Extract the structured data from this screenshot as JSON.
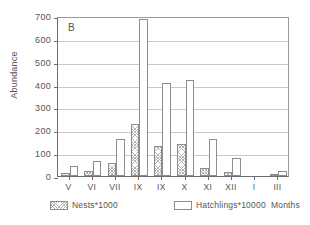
{
  "panel": {
    "letter": "B"
  },
  "axis": {
    "ylabel": "Abundance",
    "xlabel": "Months"
  },
  "legend": {
    "nests_label": "Nests*1000",
    "hatchlings_label": "Hatchlings*10000"
  },
  "chart_data": {
    "type": "bar",
    "title": "B",
    "xlabel": "Months",
    "ylabel": "Abundance",
    "ylim": [
      0,
      700
    ],
    "yticks": [
      0,
      100,
      200,
      300,
      400,
      500,
      600,
      700
    ],
    "grid": true,
    "legend_position": "below-axis",
    "categories": [
      "V",
      "VI",
      "VII",
      "IX",
      "IX",
      "X",
      "XI",
      "XII",
      "I",
      "III"
    ],
    "series": [
      {
        "name": "Nests*1000",
        "values": [
          15,
          22,
          57,
          228,
          133,
          140,
          35,
          18,
          0,
          7
        ]
      },
      {
        "name": "Hatchlings*10000",
        "values": [
          45,
          65,
          163,
          685,
          408,
          420,
          163,
          78,
          0,
          22
        ]
      }
    ]
  }
}
